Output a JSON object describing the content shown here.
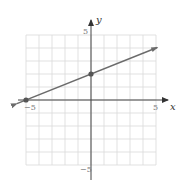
{
  "chart_data": {
    "type": "line",
    "title": "",
    "xlabel": "x",
    "ylabel": "y",
    "xlim": [
      -5,
      5
    ],
    "ylim": [
      -5,
      5
    ],
    "grid": true,
    "x_ticks_labeled": [
      -5,
      5
    ],
    "y_ticks_labeled": [
      5,
      -5
    ],
    "tick_labels": {
      "x_neg": "−5",
      "x_pos": "5",
      "y_pos": "5",
      "y_neg": "−5"
    },
    "series": [
      {
        "name": "line",
        "equation": "y = (2/5)x + 2",
        "slope": 0.4,
        "intercept": 2,
        "points": [
          {
            "x": -5,
            "y": 0
          },
          {
            "x": 0,
            "y": 2
          }
        ],
        "arrows_both_ends": true,
        "color": "#6b6b6b"
      }
    ],
    "colors": {
      "grid": "#d9d9d9",
      "axis": "#444444",
      "line": "#6b6b6b",
      "point": "#555555"
    }
  }
}
